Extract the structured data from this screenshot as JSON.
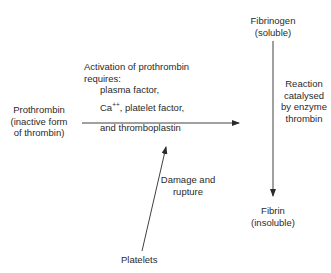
{
  "nodes": {
    "fibrinogen": {
      "line1": "Fibrinogen",
      "line2": "(soluble)"
    },
    "prothrombin": {
      "line1": "Prothrombin",
      "line2": "(inactive form",
      "line3": "of thrombin)"
    },
    "fibrin": {
      "line1": "Fibrin",
      "line2": "(insoluble)"
    },
    "platelets": {
      "label": "Platelets"
    }
  },
  "edges": {
    "activation": {
      "line1": "Activation of prothrombin",
      "line2": "requires:",
      "line3": "plasma factor,",
      "line4_prefix": "Ca",
      "line4_sup": "++",
      "line4_suffix": ", platelet factor,",
      "line5": "and thromboplastin"
    },
    "reaction": {
      "line1": "Reaction",
      "line2": "catalysed",
      "line3": "by enzyme",
      "line4": "thrombin"
    },
    "damage": {
      "line1": "Damage and",
      "line2": "rupture"
    }
  },
  "colors": {
    "ink": "#2a2a2a",
    "background": "#ffffff"
  }
}
